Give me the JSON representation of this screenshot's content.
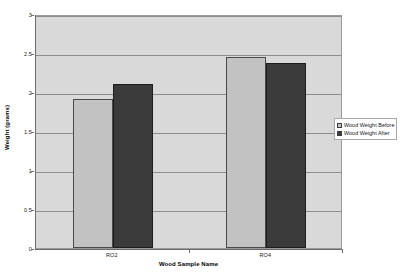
{
  "chart_data": {
    "type": "bar",
    "title": "",
    "subtitle": "",
    "xlabel": "Wood Sample Name",
    "ylabel": "Weight (grams)",
    "categories": [
      "RO2",
      "RO4"
    ],
    "series": [
      {
        "name": "Wood Weight Before",
        "values": [
          1.91,
          2.45
        ],
        "color": "#c2c2c2"
      },
      {
        "name": "Wood Weight After",
        "values": [
          2.1,
          2.37
        ],
        "color": "#3b3b3b"
      }
    ],
    "ylim": [
      0,
      3
    ],
    "ytick_labels": [
      "0",
      "0.5",
      "1",
      "1.5",
      "2",
      "2.5",
      "3"
    ],
    "ytick_values": [
      0,
      0.5,
      1,
      1.5,
      2,
      2.5,
      3
    ],
    "grid": true,
    "grid_axis": "y",
    "legend_position": "right",
    "plot_background": "#d9d9d9",
    "figure_background": "#ffffff",
    "gridline_color": "#8d8d8d",
    "axis_color": "#6b6b6b"
  }
}
